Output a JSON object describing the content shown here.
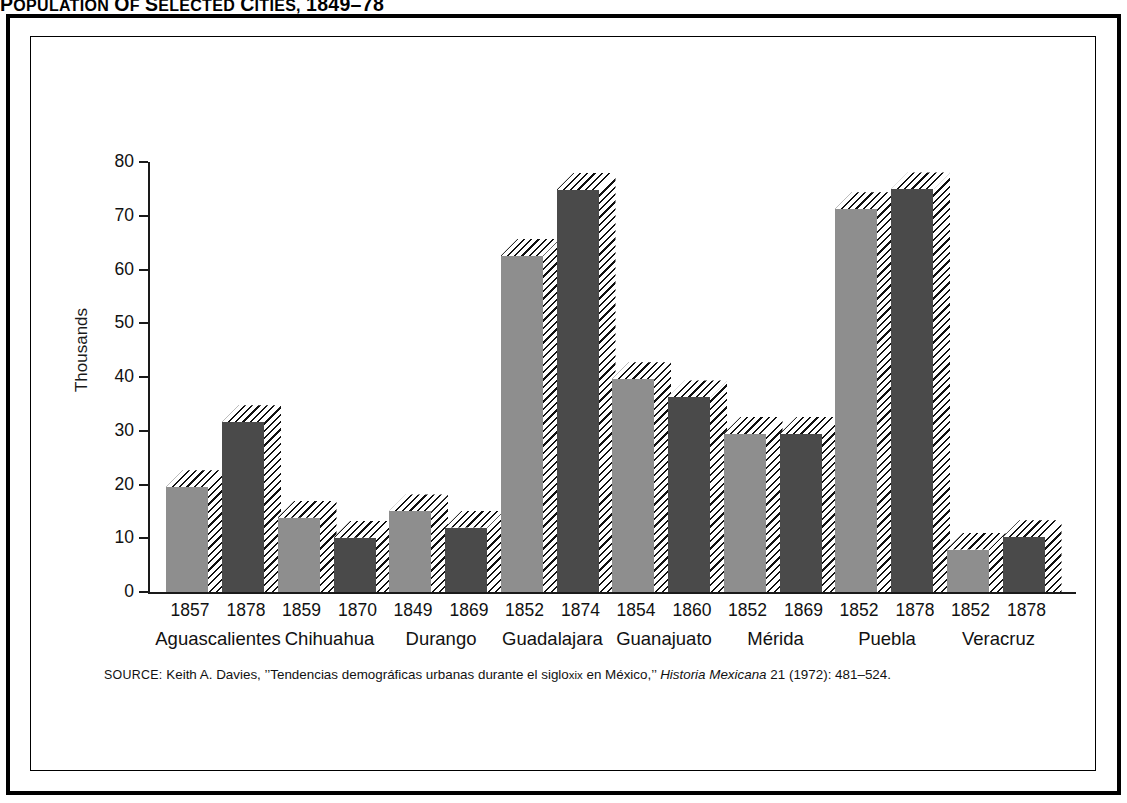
{
  "title": {
    "full": "POPULATION OF SELECTED CITIES, 1849-78",
    "lead": "P",
    "word1": "OPULATION",
    "of_lead": "O",
    "of_rest": "F",
    "word2_lead": "S",
    "word2_rest": "ELECTED",
    "word3_lead": "C",
    "word3_rest": "ITIES,",
    "years": "1849–78"
  },
  "axes": {
    "ylabel": "Thousands",
    "yticks": [
      "80",
      "70",
      "60",
      "50",
      "40",
      "30",
      "20",
      "10",
      "0"
    ],
    "ymin": 0,
    "ymax": 80
  },
  "source": {
    "keyword": "SOURCE:",
    "author": "Keith A. Davies,",
    "article_open": "’’Tendencias demográficas urbanas durante el siglo",
    "century": "xix",
    "article_close": "en México,’’",
    "journal": "Historia Mexicana",
    "volume": "21",
    "year": "(1972)",
    "pages": ": 481–524."
  },
  "colors": {
    "bar_light": "#8e8e8e",
    "bar_dark": "#4a4a4a",
    "axis": "#1a1a1a",
    "frame": "#000000",
    "background": "#ffffff"
  },
  "chart_data": {
    "type": "bar",
    "xlabel": "",
    "ylabel": "Thousands",
    "ylim": [
      0,
      80
    ],
    "ytick_step": 10,
    "grid": false,
    "legend": null,
    "units": "thousands of inhabitants",
    "categories": [
      "Aguascalientes",
      "Chihuahua",
      "Durango",
      "Guadalajara",
      "Guanajuato",
      "Mérida",
      "Puebla",
      "Veracruz"
    ],
    "series": [
      {
        "name": "Earlier year",
        "style": "light-gray",
        "years": [
          "1857",
          "1859",
          "1849",
          "1852",
          "1854",
          "1852",
          "1852",
          "1852"
        ],
        "values": [
          19.5,
          13.8,
          15.0,
          62.5,
          39.6,
          29.4,
          71.2,
          7.9
        ]
      },
      {
        "name": "Later year",
        "style": "dark-gray",
        "years": [
          "1878",
          "1870",
          "1869",
          "1874",
          "1860",
          "1869",
          "1878",
          "1878"
        ],
        "values": [
          31.6,
          10.1,
          12.0,
          74.8,
          36.2,
          29.4,
          74.9,
          10.2
        ]
      }
    ],
    "groups": [
      {
        "city": "Aguascalientes",
        "bars": [
          {
            "year": "1857",
            "value": 19.5
          },
          {
            "year": "1878",
            "value": 31.6
          }
        ]
      },
      {
        "city": "Chihuahua",
        "bars": [
          {
            "year": "1859",
            "value": 13.8
          },
          {
            "year": "1870",
            "value": 10.1
          }
        ]
      },
      {
        "city": "Durango",
        "bars": [
          {
            "year": "1849",
            "value": 15.0
          },
          {
            "year": "1869",
            "value": 12.0
          }
        ]
      },
      {
        "city": "Guadalajara",
        "bars": [
          {
            "year": "1852",
            "value": 62.5
          },
          {
            "year": "1874",
            "value": 74.8
          }
        ]
      },
      {
        "city": "Guanajuato",
        "bars": [
          {
            "year": "1854",
            "value": 39.6
          },
          {
            "year": "1860",
            "value": 36.2
          }
        ]
      },
      {
        "city": "Mérida",
        "bars": [
          {
            "year": "1852",
            "value": 29.4
          },
          {
            "year": "1869",
            "value": 29.4
          }
        ]
      },
      {
        "city": "Puebla",
        "bars": [
          {
            "year": "1852",
            "value": 71.2
          },
          {
            "year": "1878",
            "value": 74.9
          }
        ]
      },
      {
        "city": "Veracruz",
        "bars": [
          {
            "year": "1852",
            "value": 7.9
          },
          {
            "year": "1878",
            "value": 10.2
          }
        ]
      }
    ]
  }
}
